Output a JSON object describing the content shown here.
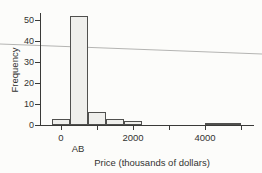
{
  "figure": {
    "ylabel": "Frequency",
    "xlabel": "Price (thousands of dollars)",
    "annotation": "AB"
  },
  "chart_data": {
    "type": "bar",
    "subtype": "histogram",
    "title": "",
    "xlabel": "Price (thousands of dollars)",
    "ylabel": "Frequency",
    "annotation": "AB",
    "y_ticks": [
      0,
      10,
      20,
      30,
      40,
      50
    ],
    "x_ticks_labeled": [
      0,
      2000,
      4000
    ],
    "x_ticks_minor": [
      1000,
      3000,
      5000
    ],
    "xlim": [
      -600,
      5600
    ],
    "ylim": [
      0,
      55
    ],
    "bin_width": 500,
    "bins": [
      {
        "center": 0,
        "count": 3
      },
      {
        "center": 500,
        "count": 52
      },
      {
        "center": 1000,
        "count": 6
      },
      {
        "center": 1500,
        "count": 3
      },
      {
        "center": 2000,
        "count": 2
      },
      {
        "center": 4250,
        "count": 1
      },
      {
        "center": 4750,
        "count": 1
      }
    ],
    "grid": false,
    "legend": "none",
    "colors": {
      "bar_fill": "#efefec",
      "bar_border": "#50504e",
      "axis": "#3a3a38",
      "text": "#333331",
      "stray_line": "#b4b4b2",
      "background": "#fcfcfa"
    },
    "stray_line": {
      "x1": 0,
      "y1": 44,
      "x2": 262,
      "y2": 54
    }
  }
}
